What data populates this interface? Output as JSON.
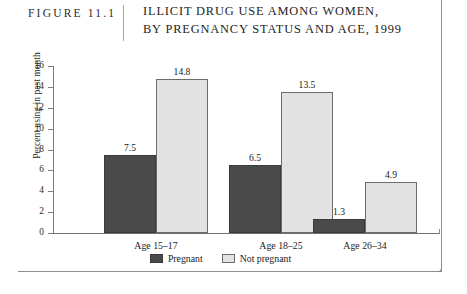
{
  "header": {
    "figure_number": "FIGURE 11.1",
    "title_lines": [
      "ILLICIT DRUG USE AMONG WOMEN,",
      "BY PREGNANCY STATUS AND AGE, 1999"
    ]
  },
  "chart_data": {
    "type": "bar",
    "title": "ILLICIT DRUG USE AMONG WOMEN, BY PREGNANCY STATUS AND AGE, 1999",
    "xlabel": "",
    "ylabel": "Percent using in past month",
    "ylim": [
      0,
      16
    ],
    "yticks": [
      "0",
      "2",
      "4",
      "6",
      "8",
      "10",
      "12",
      "14",
      "16"
    ],
    "grid": false,
    "legend_position": "bottom-center",
    "categories": [
      "Age 15–17",
      "Age 18–25",
      "Age 26–34"
    ],
    "series": [
      {
        "name": "Pregnant",
        "color": "#4a4a4a",
        "values": [
          7.5,
          6.5,
          1.3
        ],
        "labels": [
          "7.5",
          "6.5",
          "1.3"
        ]
      },
      {
        "name": "Not pregnant",
        "color": "#e2e2e2",
        "values": [
          14.8,
          13.5,
          4.9
        ],
        "labels": [
          "14.8",
          "13.5",
          "4.9"
        ]
      }
    ]
  },
  "colors": {
    "pregnant": "#4a4a4a",
    "not_pregnant": "#e2e2e2",
    "axis": "#7d7d7d",
    "frame": "#8e8e8e",
    "background": "#ffffff"
  }
}
